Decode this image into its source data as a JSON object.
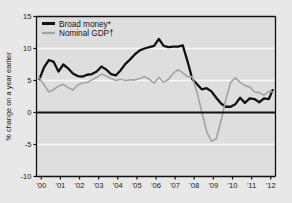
{
  "figure": {
    "cut_off_title_fragment": "",
    "background_color": "#e8e8e8",
    "plot_background_color": "#dedede",
    "frame_color": "#111111"
  },
  "chart_data": {
    "type": "line",
    "title": "",
    "subtitle": "",
    "xlabel": "",
    "ylabel": "% change on a year earlier",
    "ylim": [
      -10,
      15
    ],
    "yticks": [
      15,
      10,
      5,
      0,
      -5,
      -10
    ],
    "ytick_labels": [
      "15",
      "10",
      "5",
      "0",
      "-5",
      "-10"
    ],
    "xlim": [
      1999.75,
      2012.25
    ],
    "xticks": [
      2000,
      2001,
      2002,
      2003,
      2004,
      2005,
      2006,
      2007,
      2008,
      2009,
      2010,
      2011,
      2012
    ],
    "xtick_labels": [
      "'00",
      "'01",
      "'02",
      "'03",
      "'04",
      "'05",
      "'06",
      "'07",
      "'08",
      "'09",
      "'10",
      "'11",
      "'12"
    ],
    "grid": "horizontal-white",
    "zero_line": 0,
    "legend_position": "top-left",
    "series": [
      {
        "name": "Broad money*",
        "color": "#111111",
        "width": 2.3,
        "x": [
          1999.9,
          2000.15,
          2000.4,
          2000.65,
          2000.9,
          2001.15,
          2001.4,
          2001.65,
          2001.9,
          2002.15,
          2002.4,
          2002.65,
          2002.9,
          2003.15,
          2003.4,
          2003.65,
          2003.9,
          2004.15,
          2004.4,
          2004.65,
          2004.9,
          2005.15,
          2005.4,
          2005.65,
          2005.9,
          2006.15,
          2006.4,
          2006.65,
          2006.9,
          2007.15,
          2007.4,
          2007.65,
          2007.9,
          2008.15,
          2008.4,
          2008.65,
          2008.9,
          2009.15,
          2009.4,
          2009.65,
          2009.9,
          2010.15,
          2010.4,
          2010.65,
          2010.9,
          2011.15,
          2011.4,
          2011.65,
          2011.9,
          2012.1
        ],
        "values": [
          5.2,
          7.1,
          8.2,
          7.9,
          6.4,
          7.5,
          6.9,
          6.1,
          5.7,
          5.6,
          5.9,
          6.0,
          6.4,
          7.2,
          6.7,
          6.0,
          5.8,
          6.6,
          7.6,
          8.3,
          9.1,
          9.7,
          10.0,
          10.2,
          10.4,
          11.5,
          10.4,
          10.2,
          10.3,
          10.3,
          10.5,
          8.0,
          5.2,
          4.4,
          3.6,
          3.8,
          3.3,
          2.3,
          1.4,
          0.9,
          0.9,
          1.3,
          2.3,
          1.5,
          2.2,
          2.1,
          1.6,
          2.2,
          2.1,
          3.5
        ]
      },
      {
        "name": "Nominal GDP†",
        "color": "#a3a3a3",
        "width": 1.6,
        "x": [
          1999.9,
          2000.15,
          2000.4,
          2000.65,
          2000.9,
          2001.15,
          2001.4,
          2001.65,
          2001.9,
          2002.15,
          2002.4,
          2002.65,
          2002.9,
          2003.15,
          2003.4,
          2003.65,
          2003.9,
          2004.15,
          2004.4,
          2004.65,
          2004.9,
          2005.15,
          2005.4,
          2005.65,
          2005.9,
          2006.15,
          2006.4,
          2006.65,
          2006.9,
          2007.15,
          2007.4,
          2007.65,
          2007.9,
          2008.15,
          2008.4,
          2008.65,
          2008.9,
          2009.15,
          2009.4,
          2009.65,
          2009.9,
          2010.15,
          2010.4,
          2010.65,
          2010.9,
          2011.15,
          2011.4,
          2011.65,
          2011.9,
          2012.1
        ],
        "values": [
          5.4,
          4.3,
          3.2,
          3.6,
          4.1,
          4.4,
          3.9,
          3.5,
          4.3,
          4.6,
          4.7,
          5.1,
          5.5,
          6.0,
          5.7,
          5.3,
          5.0,
          5.2,
          5.0,
          5.1,
          5.1,
          5.3,
          5.6,
          5.2,
          4.6,
          5.5,
          4.7,
          5.2,
          6.1,
          6.7,
          6.2,
          5.6,
          5.6,
          3.1,
          0.0,
          -3.0,
          -4.5,
          -4.1,
          -1.3,
          2.0,
          4.7,
          5.4,
          4.7,
          4.2,
          4.0,
          3.2,
          3.1,
          2.7,
          3.3,
          3.2
        ]
      }
    ]
  }
}
